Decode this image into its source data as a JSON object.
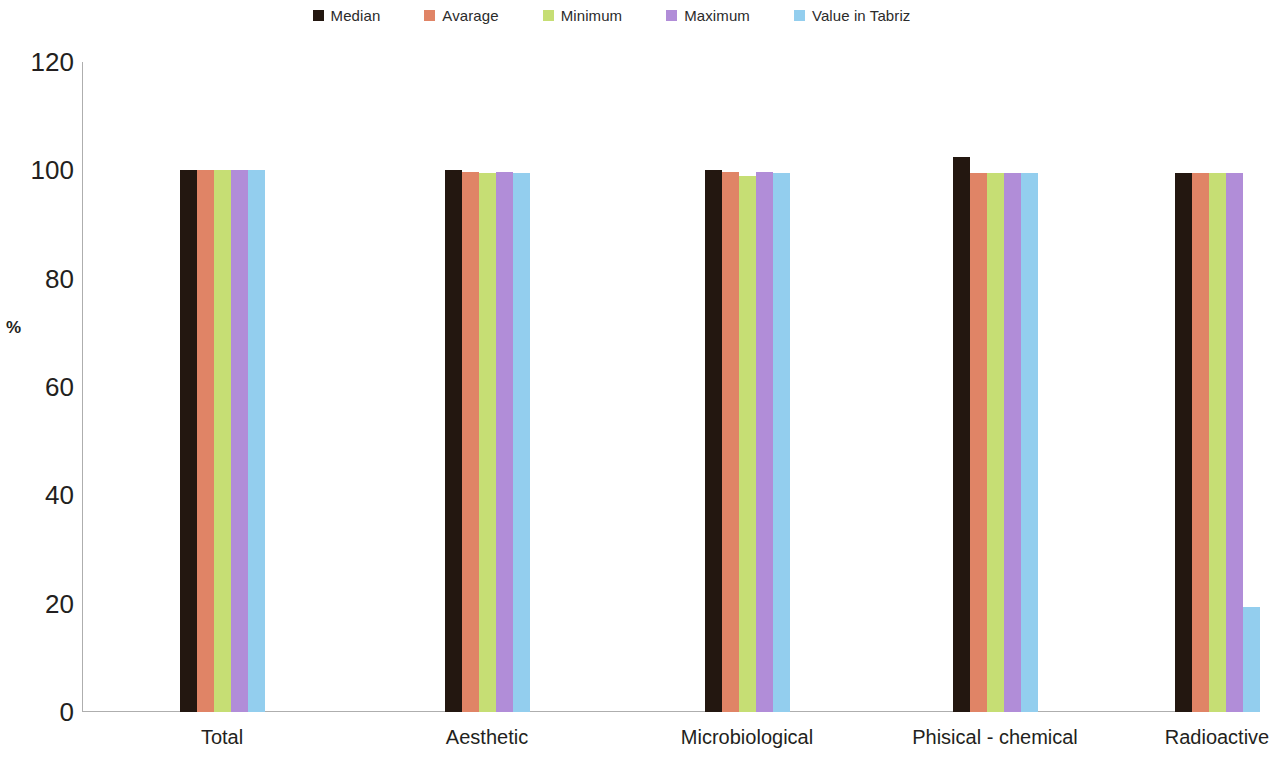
{
  "chart_data": {
    "type": "bar",
    "title": "",
    "subtitle": "",
    "xlabel": "",
    "ylabel": "%",
    "ylim": [
      0,
      120
    ],
    "yticks": [
      0,
      20,
      40,
      60,
      80,
      100,
      120
    ],
    "grid": false,
    "legend_position": "top-center",
    "categories": [
      "Total",
      "Aesthetic",
      "Microbiological",
      "Phisical - chemical",
      "Radioactive"
    ],
    "series": [
      {
        "name": "Median",
        "color": "#231710",
        "values": [
          100,
          100,
          100,
          102.5,
          99.5
        ]
      },
      {
        "name": "Avarage",
        "color": "#E08466",
        "values": [
          100,
          99.7,
          99.7,
          99.6,
          99.5
        ]
      },
      {
        "name": "Minimum",
        "color": "#C6DE74",
        "values": [
          100,
          99.6,
          99.0,
          99.5,
          99.5
        ]
      },
      {
        "name": "Maximum",
        "color": "#B18DD8",
        "values": [
          100,
          99.7,
          99.7,
          99.6,
          99.5
        ]
      },
      {
        "name": "Value  in Tabriz",
        "color": "#93CEEE",
        "values": [
          100,
          99.6,
          99.6,
          99.5,
          19.4
        ]
      }
    ]
  },
  "legend": {
    "items": [
      {
        "label": "Median",
        "color": "#231710"
      },
      {
        "label": "Avarage",
        "color": "#E08466"
      },
      {
        "label": "Minimum",
        "color": "#C6DE74"
      },
      {
        "label": "Maximum",
        "color": "#B18DD8"
      },
      {
        "label": "Value  in Tabriz",
        "color": "#93CEEE"
      }
    ]
  },
  "axes": {
    "y_title": "%",
    "y_tick_labels": [
      "120",
      "100",
      "80",
      "60",
      "40",
      "20",
      "0"
    ],
    "x_tick_labels": [
      "Total",
      "Aesthetic",
      "Microbiological",
      "Phisical - chemical",
      "Radioactive"
    ]
  },
  "colors": {
    "axis_line": "#aeaeae",
    "text": "#231f20",
    "background": "#ffffff"
  }
}
